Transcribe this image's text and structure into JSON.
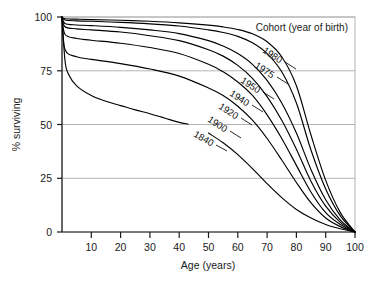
{
  "chart_data": {
    "type": "line",
    "title": "",
    "legend_title": "Cohort (year of birth)",
    "legend_position": "top-right-inside",
    "xlabel": "Age (years)",
    "ylabel": "% surviving",
    "xlim": [
      0,
      100
    ],
    "ylim": [
      0,
      100
    ],
    "xticks": [
      10,
      20,
      30,
      40,
      50,
      60,
      70,
      80,
      90,
      100
    ],
    "xtick_labels": [
      "10",
      "20",
      "30",
      "40",
      "50",
      "60",
      "70",
      "80",
      "90",
      "100"
    ],
    "yticks": [
      0,
      25,
      50,
      75,
      100
    ],
    "ytick_labels": [
      "0",
      "25",
      "50",
      "75",
      "100"
    ],
    "grid": "horizontal",
    "grid_color": "#b4b4b4",
    "line_color": "#000000",
    "series": [
      {
        "name": "1980",
        "label": "1980",
        "x": [
          0,
          1,
          5,
          10,
          20,
          30,
          40,
          50,
          55,
          60,
          65,
          70,
          75,
          80,
          85,
          90,
          95,
          100
        ],
        "values": [
          100,
          99.2,
          99.0,
          98.8,
          98.5,
          98.0,
          97.3,
          96.2,
          95.4,
          94.2,
          92.2,
          88.5,
          81.5,
          68.0,
          45.0,
          24.0,
          9.0,
          0
        ]
      },
      {
        "name": "1975",
        "label": "1975",
        "x": [
          0,
          1,
          5,
          10,
          20,
          30,
          40,
          50,
          55,
          60,
          65,
          70,
          75,
          80,
          85,
          90,
          95,
          100
        ],
        "values": [
          100,
          98.6,
          98.2,
          98.0,
          97.5,
          96.8,
          95.8,
          94.0,
          92.8,
          91.0,
          88.0,
          83.0,
          74.5,
          60.0,
          38.0,
          20.0,
          7.5,
          0
        ]
      },
      {
        "name": "1950",
        "label": "1950",
        "x": [
          0,
          1,
          5,
          10,
          20,
          30,
          40,
          50,
          55,
          60,
          65,
          70,
          75,
          80,
          85,
          90,
          95,
          100
        ],
        "values": [
          100,
          97.0,
          96.3,
          96.0,
          95.2,
          94.0,
          92.3,
          89.0,
          86.5,
          83.0,
          78.0,
          70.5,
          60.0,
          46.0,
          29.0,
          15.0,
          5.5,
          0
        ]
      },
      {
        "name": "1940",
        "label": "1940",
        "x": [
          0,
          1,
          5,
          10,
          20,
          30,
          40,
          50,
          55,
          60,
          65,
          70,
          75,
          80,
          85,
          90,
          95,
          100
        ],
        "values": [
          100,
          95.5,
          94.5,
          94.0,
          93.0,
          91.3,
          89.0,
          84.8,
          81.8,
          77.5,
          71.5,
          63.0,
          52.0,
          38.5,
          23.5,
          12.0,
          4.5,
          0
        ]
      },
      {
        "name": "1920",
        "label": "1920",
        "x": [
          0,
          1,
          5,
          10,
          20,
          30,
          40,
          50,
          55,
          60,
          65,
          70,
          75,
          80,
          85,
          90,
          95,
          100
        ],
        "values": [
          100,
          92.0,
          90.0,
          89.2,
          87.8,
          85.8,
          83.0,
          78.0,
          74.5,
          69.8,
          63.5,
          54.5,
          43.5,
          31.0,
          18.5,
          9.0,
          3.5,
          0
        ]
      },
      {
        "name": "1900",
        "label": "1900",
        "x": [
          0,
          1,
          5,
          10,
          20,
          30,
          40,
          50,
          55,
          60,
          65,
          70,
          75,
          80,
          85,
          90,
          95,
          100
        ],
        "values": [
          100,
          85.0,
          81.5,
          80.3,
          78.3,
          75.8,
          72.5,
          67.0,
          63.5,
          58.5,
          52.0,
          43.5,
          33.5,
          23.0,
          13.5,
          6.5,
          2.5,
          0
        ]
      },
      {
        "name": "1840",
        "label": "1840",
        "x": [
          0,
          1,
          2,
          5,
          10,
          15,
          20,
          25,
          30,
          35,
          40,
          43
        ],
        "values": [
          100,
          80.0,
          74.0,
          68.0,
          63.5,
          60.8,
          58.8,
          56.8,
          55.0,
          53.0,
          51.0,
          50.2
        ],
        "x2": [
          50,
          55,
          60,
          65,
          70,
          75,
          80,
          85,
          90,
          95,
          100
        ],
        "values2": [
          46.0,
          41.5,
          36.0,
          29.5,
          22.5,
          16.0,
          10.5,
          6.5,
          3.5,
          1.5,
          0
        ],
        "note": "curve interrupted by its own label between age 43 and 50"
      }
    ],
    "labels": [
      {
        "text": "1980",
        "x": 1980
      },
      {
        "text": "1975",
        "x": 1975
      },
      {
        "text": "1950",
        "x": 1950
      },
      {
        "text": "1940",
        "x": 1940
      },
      {
        "text": "1920",
        "x": 1920
      },
      {
        "text": "1900",
        "x": 1900
      },
      {
        "text": "1840",
        "x": 1840
      }
    ]
  }
}
